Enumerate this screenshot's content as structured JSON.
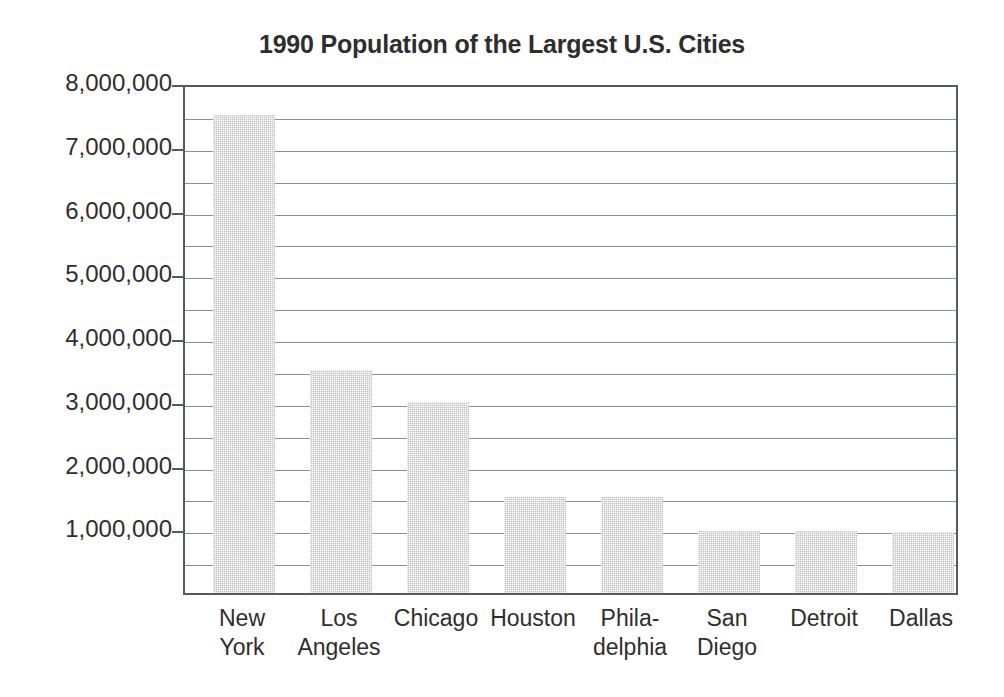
{
  "chart_data": {
    "type": "bar",
    "title": "1990 Population of the Largest U.S. Cities",
    "xlabel": "",
    "ylabel": "",
    "ylim": [
      0,
      8000000
    ],
    "grid": true,
    "gridline_interval": 500000,
    "tick_interval": 1000000,
    "legend": null,
    "bar_color": "#c9c9c9",
    "categories": [
      "New York",
      "Los Angeles",
      "Chicago",
      "Houston",
      "Philadelphia",
      "San Diego",
      "Detroit",
      "Dallas"
    ],
    "category_label_lines": [
      [
        "New",
        "York"
      ],
      [
        "Los",
        "Angeles"
      ],
      [
        "Chicago",
        ""
      ],
      [
        "Houston",
        ""
      ],
      [
        "Phila-",
        "delphia"
      ],
      [
        "San",
        "Diego"
      ],
      [
        "Detroit",
        ""
      ],
      [
        "Dallas",
        ""
      ]
    ],
    "values": [
      7500000,
      3500000,
      3000000,
      1500000,
      1500000,
      980000,
      980000,
      960000
    ],
    "y_tick_labels": [
      "8,000,000",
      "7,000,000",
      "6,000,000",
      "5,000,000",
      "4,000,000",
      "3,000,000",
      "2,000,000",
      "1,000,000"
    ],
    "y_tick_values": [
      8000000,
      7000000,
      6000000,
      5000000,
      4000000,
      3000000,
      2000000,
      1000000
    ]
  }
}
